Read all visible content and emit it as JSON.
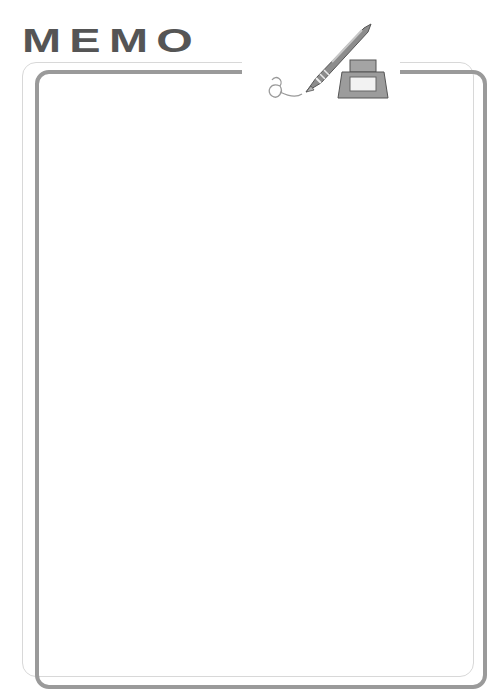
{
  "header": {
    "title": "MEMO"
  },
  "decoration": {
    "icons": [
      "fountain-pen-icon",
      "ink-bottle-icon",
      "ink-squiggle-icon"
    ]
  },
  "memo": {
    "body_text": ""
  },
  "colors": {
    "title": "#555555",
    "frame_thick": "#9a9a9a",
    "frame_thin": "#d8d8d8",
    "background": "#ffffff"
  }
}
